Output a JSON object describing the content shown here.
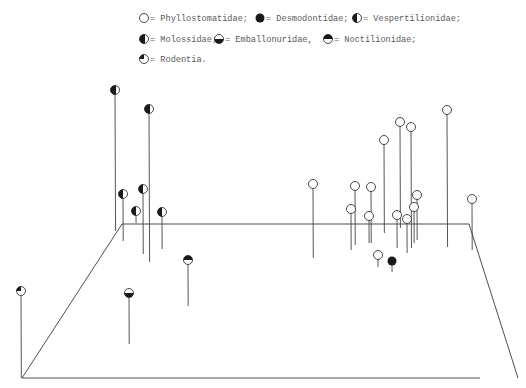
{
  "chart_data": {
    "type": "scatter",
    "subtype": "3d-stem-plot",
    "title": "",
    "xlabel": "",
    "ylabel": "",
    "zlabel": "",
    "grid": false,
    "legend_position": "top",
    "legend": [
      {
        "key": "phyllostomatidae",
        "label": "= Phyllostomatidae;",
        "marker": "open"
      },
      {
        "key": "desmodontidae",
        "label": "= Desmodontidae;",
        "marker": "filled"
      },
      {
        "key": "vespertilionidae",
        "label": "= Vespertilionidae;",
        "marker": "left-half"
      },
      {
        "key": "molossidae",
        "label": "= Molossidae;",
        "marker": "left-half-large"
      },
      {
        "key": "emballonuridae",
        "label": "= Emballonuridae,",
        "marker": "bottom-half"
      },
      {
        "key": "noctilionidae",
        "label": "= Noctilionidae;",
        "marker": "top-half"
      },
      {
        "key": "rodentia",
        "label": "= Rodentia.",
        "marker": "quarter"
      }
    ],
    "box": {
      "front_left": [
        22,
        378
      ],
      "front_right": [
        518,
        378
      ],
      "back_left": [
        122,
        224
      ],
      "back_right": [
        469,
        224
      ]
    },
    "series": [
      {
        "name": "Phyllostomatidae",
        "points": [
          {
            "x": 313,
            "y": 184,
            "base": 258
          },
          {
            "x": 355,
            "y": 186,
            "base": 245
          },
          {
            "x": 371,
            "y": 187,
            "base": 243
          },
          {
            "x": 351,
            "y": 209,
            "base": 250
          },
          {
            "x": 369,
            "y": 216,
            "base": 243
          },
          {
            "x": 447,
            "y": 110,
            "base": 247
          },
          {
            "x": 400,
            "y": 122,
            "base": 228
          },
          {
            "x": 411,
            "y": 127,
            "base": 248
          },
          {
            "x": 384,
            "y": 140,
            "base": 233
          },
          {
            "x": 417,
            "y": 195,
            "base": 240
          },
          {
            "x": 414,
            "y": 207,
            "base": 243
          },
          {
            "x": 397,
            "y": 215,
            "base": 248
          },
          {
            "x": 407,
            "y": 219,
            "base": 253
          },
          {
            "x": 472,
            "y": 199,
            "base": 250
          },
          {
            "x": 378,
            "y": 255,
            "base": 267
          }
        ]
      },
      {
        "name": "Desmodontidae",
        "points": [
          {
            "x": 392,
            "y": 261,
            "base": 272
          }
        ]
      },
      {
        "name": "Vespertilionidae",
        "points": [
          {
            "x": 123,
            "y": 194,
            "base": 241
          },
          {
            "x": 143,
            "y": 189,
            "base": 254
          },
          {
            "x": 136,
            "y": 211,
            "base": 223
          },
          {
            "x": 162,
            "y": 212,
            "base": 249
          }
        ]
      },
      {
        "name": "Molossidae",
        "points": [
          {
            "x": 115,
            "y": 90,
            "base": 231
          },
          {
            "x": 149,
            "y": 109,
            "base": 262
          }
        ]
      },
      {
        "name": "Emballonuridae",
        "points": [
          {
            "x": 129,
            "y": 293,
            "base": 344
          }
        ]
      },
      {
        "name": "Noctilionidae",
        "points": [
          {
            "x": 188,
            "y": 260,
            "base": 306
          }
        ]
      },
      {
        "name": "Rodentia",
        "points": [
          {
            "x": 21,
            "y": 291,
            "base": 378
          }
        ]
      }
    ]
  },
  "legend": {
    "row1": [
      "= Phyllostomatidae;",
      "= Desmodontidae;",
      "= Vespertilionidae;"
    ],
    "row2": [
      "= Molossidae;",
      "= Emballonuridae,",
      "= Noctilionidae;"
    ],
    "row3": [
      "= Rodentia."
    ]
  }
}
